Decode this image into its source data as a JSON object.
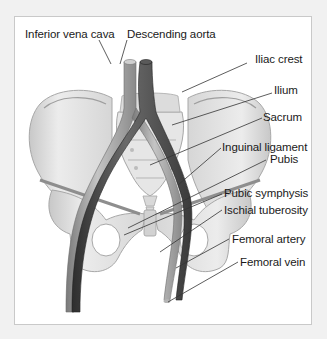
{
  "diagram": {
    "colors": {
      "outer_background": "#f1f1f1",
      "panel_background": "#ffffff",
      "panel_border": "#c9c9c9",
      "bone_fill": "#e4e4e4",
      "bone_shadow": "#bdbdbd",
      "vein_color": "#9a9a9a",
      "artery_color": "#4a4a4a",
      "leader_line": "#333333",
      "label_text": "#1a1a1a"
    },
    "labels": {
      "inferior_vena_cava": "Inferior vena cava",
      "descending_aorta": "Descending aorta",
      "iliac_crest": "Iliac crest",
      "ilium": "Ilium",
      "sacrum": "Sacrum",
      "inguinal_ligament": "Inguinal ligament",
      "pubis": "Pubis",
      "pubic_symphysis": "Pubic symphysis",
      "ischial_tuberosity": "Ischial tuberosity",
      "femoral_artery": "Femoral artery",
      "femoral_vein": "Femoral vein"
    }
  }
}
